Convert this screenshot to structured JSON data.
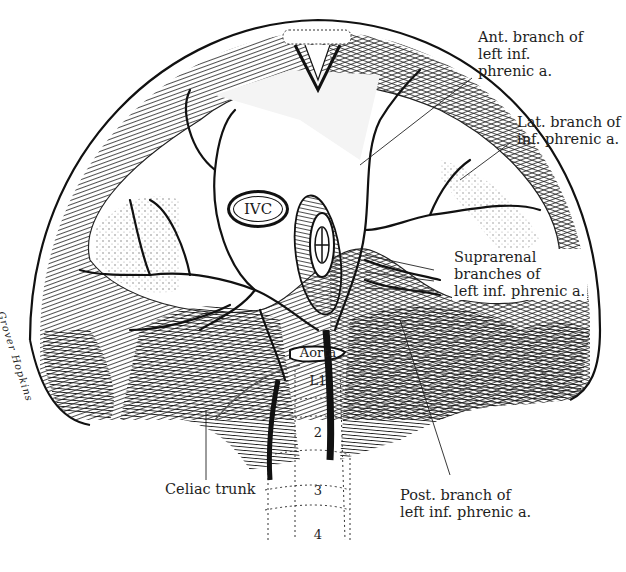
{
  "figure": {
    "type": "anatomical illustration",
    "colors": {
      "ink": "#111111",
      "background": "#ffffff",
      "muscle_fill": "#d8d8d8"
    }
  },
  "labels": {
    "ant_branch": "Ant. branch of\nleft inf.\nphrenic a.",
    "lat_branch": "Lat. branch of\ninf. phrenic a.",
    "suprarenal": "Suprarenal\nbranches of\nleft inf. phrenic a.",
    "celiac": "Celiac trunk",
    "post_branch": "Post. branch of\nleft inf. phrenic a.",
    "ivc": "IVC",
    "aorta": "Aorta",
    "vertebrae": [
      "L1",
      "2",
      "3",
      "4"
    ]
  },
  "signature": "Grover Hopkins"
}
